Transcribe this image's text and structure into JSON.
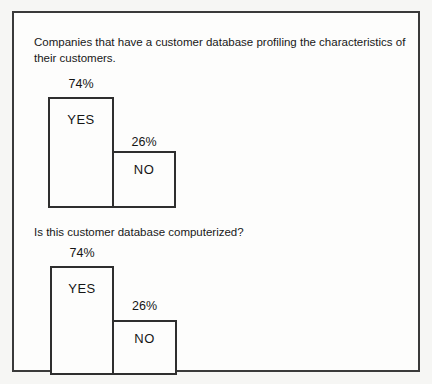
{
  "figure": {
    "background": "#fdfdfc",
    "border_color": "#3a3a3a",
    "text_color": "#1c1c1c"
  },
  "chart_data": [
    {
      "type": "bar",
      "title": "Companies that have a customer database profiling the characteristics of their customers.",
      "categories": [
        "YES",
        "NO"
      ],
      "values": [
        74,
        26
      ],
      "unit": "percent",
      "data_labels": [
        "74%",
        "26%"
      ],
      "xlabel": "",
      "ylabel": "",
      "legend": "none",
      "grid": false,
      "axes_shown": false,
      "bar_labels_inside": true,
      "note_layout": "bars adjacent sharing one edge; drawn heights not proportional to values"
    },
    {
      "type": "bar",
      "title": "Is this customer database computerized?",
      "categories": [
        "YES",
        "NO"
      ],
      "values": [
        74,
        26
      ],
      "unit": "percent",
      "data_labels": [
        "74%",
        "26%"
      ],
      "xlabel": "",
      "ylabel": "",
      "legend": "none",
      "grid": false,
      "axes_shown": false,
      "bar_labels_inside": true,
      "note_layout": "bars adjacent sharing one edge; drawn heights not proportional to values"
    }
  ]
}
